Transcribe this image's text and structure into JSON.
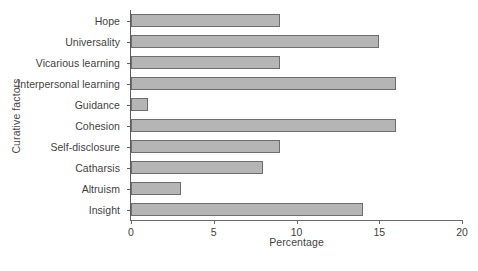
{
  "chart_data": {
    "type": "bar",
    "orientation": "horizontal",
    "title": "",
    "xlabel": "Percentage",
    "ylabel": "Curative factors",
    "categories": [
      "Hope",
      "Universality",
      "Vicarious learning",
      "Interpersonal learning",
      "Guidance",
      "Cohesion",
      "Self-disclosure",
      "Catharsis",
      "Altruism",
      "Insight"
    ],
    "values": [
      9,
      15,
      9,
      16,
      1,
      16,
      9,
      8,
      3,
      14
    ],
    "xlim": [
      0,
      20
    ],
    "xticks": [
      0,
      5,
      10,
      15,
      20
    ],
    "xtick_labels": [
      "0",
      "5",
      "10",
      "15",
      "20"
    ],
    "grid": false,
    "legend": false,
    "bar_color": "#b5b5b5",
    "bar_edge_color": "#6e6e6e",
    "axis_color": "#6a6a6a"
  }
}
